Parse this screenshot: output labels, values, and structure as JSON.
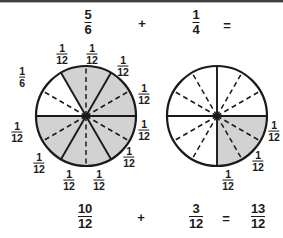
{
  "problem": {
    "top_row": {
      "left_fraction": {
        "numerator": "5",
        "denominator": "6"
      },
      "operator": "+",
      "right_fraction": {
        "numerator": "1",
        "denominator": "4"
      },
      "equals": "="
    },
    "bottom_row": {
      "left_fraction": {
        "numerator": "10",
        "denominator": "12"
      },
      "operator": "+",
      "right_fraction": {
        "numerator": "3",
        "denominator": "12"
      },
      "equals": "=",
      "result_fraction": {
        "numerator": "13",
        "denominator": "12"
      }
    }
  },
  "colors": {
    "shaded": "#d2d2d2",
    "unshaded": "#ffffff",
    "stroke": "#1a1a1a",
    "text": "#1a1a1a"
  },
  "left_circle": {
    "total_parts": 12,
    "shaded_parts": 10,
    "value": "5/6",
    "solid_divisions": 6,
    "dashed_divisions": 6,
    "labels": [
      {
        "numerator": "1",
        "denominator": "12",
        "x": 62,
        "y": 54
      },
      {
        "numerator": "1",
        "denominator": "12",
        "x": 92,
        "y": 54
      },
      {
        "numerator": "1",
        "denominator": "12",
        "x": 123,
        "y": 66
      },
      {
        "numerator": "1",
        "denominator": "12",
        "x": 144,
        "y": 94
      },
      {
        "numerator": "1",
        "denominator": "12",
        "x": 144,
        "y": 130
      },
      {
        "numerator": "1",
        "denominator": "12",
        "x": 129,
        "y": 157
      },
      {
        "numerator": "1",
        "denominator": "12",
        "x": 99,
        "y": 180
      },
      {
        "numerator": "1",
        "denominator": "12",
        "x": 69,
        "y": 180
      },
      {
        "numerator": "1",
        "denominator": "12",
        "x": 39,
        "y": 163
      },
      {
        "numerator": "1",
        "denominator": "12",
        "x": 17,
        "y": 132
      },
      {
        "numerator": "1",
        "denominator": "6",
        "x": 22,
        "y": 77
      }
    ]
  },
  "right_circle": {
    "total_parts": 12,
    "shaded_parts": 3,
    "value": "1/4",
    "solid_divisions": 4,
    "dashed_divisions": 8,
    "labels": [
      {
        "numerator": "1",
        "denominator": "12",
        "x": 274,
        "y": 131
      },
      {
        "numerator": "1",
        "denominator": "12",
        "x": 258,
        "y": 161
      },
      {
        "numerator": "1",
        "denominator": "12",
        "x": 228,
        "y": 180
      }
    ]
  }
}
